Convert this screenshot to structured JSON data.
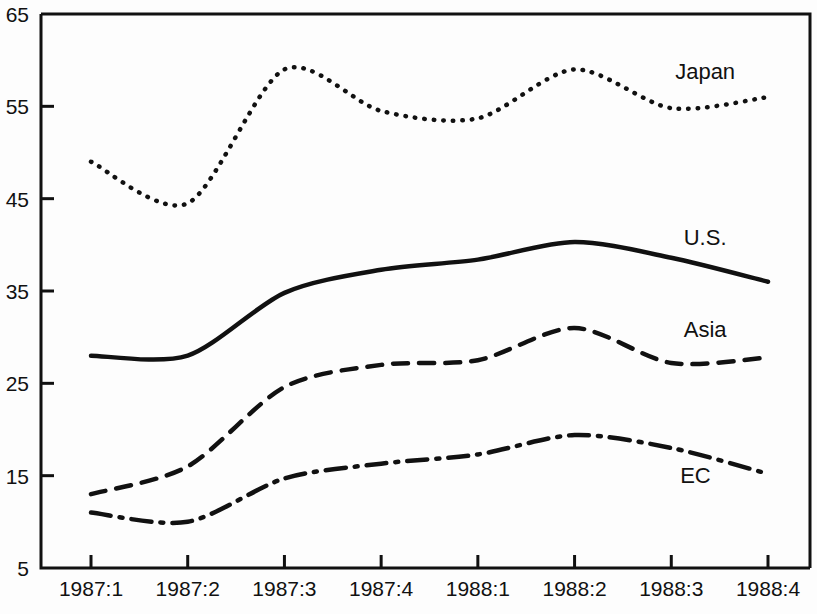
{
  "chart_data": {
    "type": "line",
    "title": "",
    "subtitle": "",
    "xlabel": "",
    "ylabel": "",
    "categories": [
      "1987:1",
      "1987:2",
      "1987:3",
      "1987:4",
      "1988:1",
      "1988:2",
      "1988:3",
      "1988:4"
    ],
    "x_tick_labels": [
      "1987:1",
      "1987:2",
      "1987:3",
      "1987:4",
      "1988:1",
      "1988:2",
      "1988:3",
      "1988:4"
    ],
    "y_tick_labels": [
      "65",
      "55",
      "45",
      "35",
      "25",
      "15",
      "5"
    ],
    "y_ticks": [
      65,
      55,
      45,
      35,
      25,
      15,
      5
    ],
    "ylim": [
      5,
      65
    ],
    "grid": false,
    "legend_position": "inline-right",
    "series": [
      {
        "name": "Japan",
        "label": "Japan",
        "style": "dotted",
        "color": "#111111",
        "values": [
          49.0,
          44.5,
          59.0,
          54.5,
          53.7,
          59.0,
          54.8,
          56.0
        ],
        "label_x_index": 6.35,
        "label_y_value": 58.0
      },
      {
        "name": "U.S.",
        "label": "U.S.",
        "style": "solid",
        "color": "#111111",
        "values": [
          28.0,
          28.0,
          34.8,
          37.3,
          38.4,
          40.3,
          38.6,
          36.0
        ],
        "label_x_index": 6.35,
        "label_y_value": 40.0
      },
      {
        "name": "Asia",
        "label": "Asia",
        "style": "dashed",
        "color": "#111111",
        "values": [
          13.0,
          16.0,
          24.6,
          27.0,
          27.5,
          31.0,
          27.2,
          27.8
        ],
        "label_x_index": 6.35,
        "label_y_value": 30.0
      },
      {
        "name": "EC",
        "label": "EC",
        "style": "dash-dot",
        "color": "#111111",
        "values": [
          11.0,
          10.0,
          14.7,
          16.3,
          17.3,
          19.4,
          18.0,
          15.2
        ],
        "label_x_index": 6.25,
        "label_y_value": 14.2
      }
    ]
  },
  "axes": {
    "y_axis_name": "value-axis",
    "x_axis_name": "period-axis"
  }
}
